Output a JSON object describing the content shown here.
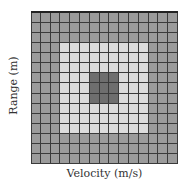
{
  "diagram": {
    "rows": 15,
    "cols": 15,
    "regions": [
      {
        "name": "outer-cells",
        "color": "#9b9b9b",
        "rows": [
          0,
          14
        ],
        "cols": [
          0,
          14
        ]
      },
      {
        "name": "inner-cells",
        "color": "#dcdcdc",
        "rows": [
          3,
          11
        ],
        "cols": [
          3,
          11
        ]
      },
      {
        "name": "center-cells",
        "color": "#6e6e6e",
        "rows": [
          6,
          8
        ],
        "cols": [
          6,
          8
        ]
      }
    ],
    "grid_line_color": "#3a3a3a"
  },
  "axes": {
    "xlabel": "Velocity (m/s)",
    "ylabel": "Range (m)"
  }
}
